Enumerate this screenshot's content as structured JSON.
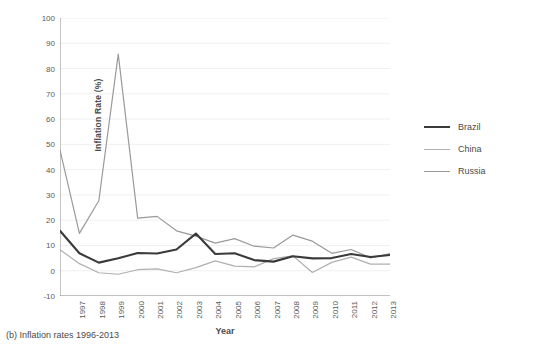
{
  "caption": "(b) Inflation rates 1996-2013",
  "axes": {
    "y_label": "Inflation Rate (%)",
    "x_label": "Year"
  },
  "legend": {
    "position": "right",
    "entries": [
      {
        "label": "Brazil",
        "color": "#3a3a3a"
      },
      {
        "label": "China",
        "color": "#b0b0b0"
      },
      {
        "label": "Russia",
        "color": "#9a9a9a"
      }
    ]
  },
  "chart_data": {
    "type": "line",
    "title": "",
    "subtitle": "",
    "xlabel": "Year",
    "ylabel": "Inflation Rate (%)",
    "grid": true,
    "legend_position": "right",
    "xlim": [
      1996,
      2013
    ],
    "ylim": [
      -10,
      100
    ],
    "ytick_values": [
      -10,
      0,
      10,
      20,
      30,
      40,
      50,
      60,
      70,
      80,
      90,
      100
    ],
    "ytick_labels": [
      "-10",
      "0",
      "10",
      "20",
      "30",
      "40",
      "50",
      "60",
      "70",
      "80",
      "90",
      "100"
    ],
    "x": [
      1996,
      1997,
      1998,
      1999,
      2000,
      2001,
      2002,
      2003,
      2004,
      2005,
      2006,
      2007,
      2008,
      2009,
      2010,
      2011,
      2012,
      2013
    ],
    "xtick_values": [
      1997,
      1998,
      1999,
      2000,
      2001,
      2002,
      2003,
      2004,
      2005,
      2006,
      2007,
      2008,
      2009,
      2010,
      2011,
      2012,
      2013
    ],
    "xtick_labels": [
      "1997",
      "1998",
      "1999",
      "2000",
      "2001",
      "2002",
      "2003",
      "2004",
      "2005",
      "2006",
      "2007",
      "2008",
      "2009",
      "2010",
      "2011",
      "2012",
      "2013"
    ],
    "series": [
      {
        "name": "Brazil",
        "color": "#3a3a3a",
        "width": 2.1,
        "values": [
          15.8,
          6.9,
          3.2,
          4.9,
          7.0,
          6.8,
          8.4,
          14.7,
          6.6,
          6.9,
          4.2,
          3.6,
          5.7,
          4.9,
          5.0,
          6.6,
          5.4,
          6.2
        ]
      },
      {
        "name": "China",
        "color": "#b0b0b0",
        "width": 1.2,
        "values": [
          8.3,
          2.8,
          -0.8,
          -1.4,
          0.4,
          0.7,
          -0.8,
          1.2,
          3.9,
          1.8,
          1.5,
          4.8,
          5.9,
          -0.7,
          3.3,
          5.4,
          2.6,
          2.6
        ]
      },
      {
        "name": "Russia",
        "color": "#9a9a9a",
        "width": 1.2,
        "values": [
          47.7,
          14.8,
          27.7,
          85.7,
          20.8,
          21.5,
          15.8,
          13.7,
          10.9,
          12.7,
          9.7,
          9.0,
          14.1,
          11.7,
          6.9,
          8.4,
          5.1,
          6.8
        ]
      }
    ]
  }
}
